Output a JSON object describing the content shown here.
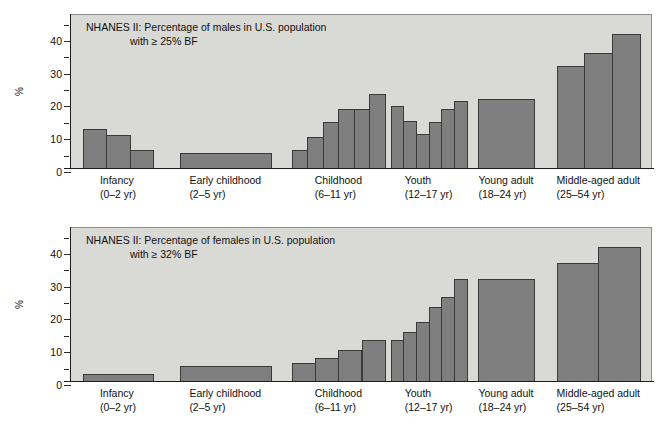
{
  "figure": {
    "ylabel": "%",
    "yticks": [
      0,
      10,
      20,
      30,
      40
    ],
    "ylim": [
      0,
      47
    ],
    "categories": [
      {
        "name": "Infancy",
        "range": "(0–2 yr)"
      },
      {
        "name": "Early childhood",
        "range": "(2–5 yr)"
      },
      {
        "name": "Childhood",
        "range": "(6–11 yr)"
      },
      {
        "name": "Youth",
        "range": "(12–17 yr)"
      },
      {
        "name": "Young adult",
        "range": "(18–24 yr)"
      },
      {
        "name": "Middle-aged adult",
        "range": "(25–54 yr)"
      }
    ],
    "colors": {
      "bar_fill": "#807f7f",
      "bar_stroke": "#3a3a3a",
      "plot_background": "#d9d9d5",
      "page_background": "#ffffff",
      "axis": "#1d1d1d"
    }
  },
  "chart_data": [
    {
      "type": "bar",
      "panel": "top",
      "title_line1": "NHANES II: Percentage of males in U.S. population",
      "title_line2": "with ≥ 25% BF",
      "xlabel": "",
      "ylabel": "%",
      "ylim": [
        0,
        47
      ],
      "yticks": [
        0,
        10,
        20,
        30,
        40
      ],
      "grid": false,
      "legend": "none",
      "categories": [
        "Infancy (0–2 yr)",
        "Early childhood (2–5 yr)",
        "Childhood (6–11 yr)",
        "Youth (12–17 yr)",
        "Young adult (18–24 yr)",
        "Middle-aged adult (25–54 yr)"
      ],
      "groups": [
        {
          "label": "Infancy",
          "values": [
            12,
            10,
            5.5
          ]
        },
        {
          "label": "Early childhood",
          "values": [
            4.5
          ]
        },
        {
          "label": "Childhood",
          "values": [
            5.5,
            9.5,
            14,
            18,
            18,
            22.5
          ]
        },
        {
          "label": "Youth",
          "values": [
            19,
            14.5,
            10.5,
            14,
            18,
            20.5
          ]
        },
        {
          "label": "Young adult",
          "values": [
            21
          ]
        },
        {
          "label": "Middle-aged adult",
          "values": [
            31,
            35,
            41
          ]
        }
      ]
    },
    {
      "type": "bar",
      "panel": "bottom",
      "title_line1": "NHANES II: Percentage of females in U.S. population",
      "title_line2": "with ≥ 32% BF",
      "xlabel": "",
      "ylabel": "%",
      "ylim": [
        0,
        47
      ],
      "yticks": [
        0,
        10,
        20,
        30,
        40
      ],
      "grid": false,
      "legend": "none",
      "categories": [
        "Infancy (0–2 yr)",
        "Early childhood (2–5 yr)",
        "Childhood (6–11 yr)",
        "Youth (12–17 yr)",
        "Young adult (18–24 yr)",
        "Middle-aged adult (25–54 yr)"
      ],
      "groups": [
        {
          "label": "Infancy",
          "values": [
            2
          ]
        },
        {
          "label": "Early childhood",
          "values": [
            4.5
          ]
        },
        {
          "label": "Childhood",
          "values": [
            5.5,
            7,
            9.5,
            12.5
          ]
        },
        {
          "label": "Youth",
          "values": [
            12.5,
            15,
            18,
            22.5,
            25.5,
            31
          ]
        },
        {
          "label": "Young adult",
          "values": [
            31
          ]
        },
        {
          "label": "Middle-aged adult",
          "values": [
            36,
            41
          ]
        }
      ]
    }
  ]
}
